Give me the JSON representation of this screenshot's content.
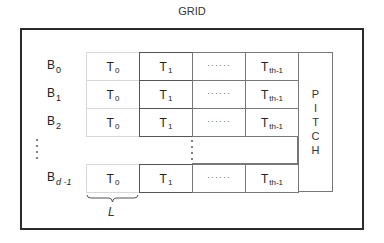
{
  "title": "GRID",
  "rows": [
    {
      "label": "B",
      "sub": "0",
      "cells": [
        {
          "t": "T",
          "s": "0"
        },
        {
          "t": "T",
          "s": "1"
        },
        {
          "t": "······",
          "s": ""
        },
        {
          "t": "T",
          "s": "th-1"
        }
      ]
    },
    {
      "label": "B",
      "sub": "1",
      "cells": [
        {
          "t": "T",
          "s": "0"
        },
        {
          "t": "T",
          "s": "1"
        },
        {
          "t": "······",
          "s": ""
        },
        {
          "t": "T",
          "s": "th-1"
        }
      ]
    },
    {
      "label": "B",
      "sub": "2",
      "cells": [
        {
          "t": "T",
          "s": "0"
        },
        {
          "t": "T",
          "s": "1"
        },
        {
          "t": "······",
          "s": ""
        },
        {
          "t": "T",
          "s": "th-1"
        }
      ]
    },
    {
      "label": "B",
      "sub": "d -1",
      "cells": [
        {
          "t": "T",
          "s": "0"
        },
        {
          "t": "T",
          "s": "1"
        },
        {
          "t": "······",
          "s": ""
        },
        {
          "t": "T",
          "s": "th-1"
        }
      ]
    }
  ],
  "pitch_letters": [
    "P",
    "I",
    "T",
    "C",
    "H"
  ],
  "brace_label": "L",
  "colors": {
    "frame": "#2a2a2a",
    "t0_border": "#d8d8d8",
    "t1_border": "#555555",
    "other_border": "#777777"
  }
}
